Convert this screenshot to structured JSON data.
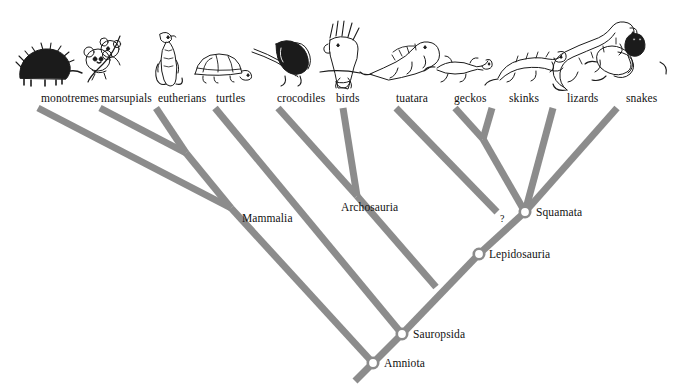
{
  "figure": {
    "background_color": "#ffffff",
    "branch_color": "#8c8c8c",
    "branch_width": 7,
    "node_marker_fill": "#ffffff",
    "node_marker_stroke": "#8c8c8c",
    "text_color": "#111111"
  },
  "taxa": [
    {
      "id": "monotremes",
      "label": "monotremes",
      "label_x": 41,
      "label_y": 92,
      "tip_x": 38,
      "tip_y": 108,
      "icon": "echidna-icon"
    },
    {
      "id": "marsupials",
      "label": "marsupials",
      "label_x": 101,
      "label_y": 92,
      "tip_x": 100,
      "tip_y": 108,
      "icon": "koala-icon"
    },
    {
      "id": "eutherians",
      "label": "eutherians",
      "label_x": 158,
      "label_y": 92,
      "tip_x": 156,
      "tip_y": 108,
      "icon": "meerkat-icon"
    },
    {
      "id": "turtles",
      "label": "turtles",
      "label_x": 216,
      "label_y": 92,
      "tip_x": 215,
      "tip_y": 108,
      "icon": "tortoise-icon"
    },
    {
      "id": "crocodiles",
      "label": "crocodiles",
      "label_x": 277,
      "label_y": 92,
      "tip_x": 278,
      "tip_y": 108,
      "icon": "crocodile-icon"
    },
    {
      "id": "birds",
      "label": "birds",
      "label_x": 336,
      "label_y": 92,
      "tip_x": 343,
      "tip_y": 108,
      "icon": "cockatoo-icon"
    },
    {
      "id": "tuatara",
      "label": "tuatara",
      "label_x": 396,
      "label_y": 92,
      "tip_x": 396,
      "tip_y": 108,
      "icon": "tuatara-icon"
    },
    {
      "id": "geckos",
      "label": "geckos",
      "label_x": 454,
      "label_y": 92,
      "tip_x": 455,
      "tip_y": 108,
      "icon": "gecko-icon"
    },
    {
      "id": "skinks",
      "label": "skinks",
      "label_x": 509,
      "label_y": 92,
      "tip_x": 492,
      "tip_y": 108,
      "icon": "skink-icon"
    },
    {
      "id": "lizards",
      "label": "lizards",
      "label_x": 567,
      "label_y": 92,
      "tip_x": 553,
      "tip_y": 108,
      "icon": "lizard-icon"
    },
    {
      "id": "snakes",
      "label": "snakes",
      "label_x": 626,
      "label_y": 92,
      "tip_x": 617,
      "tip_y": 108,
      "icon": "snake-icon"
    }
  ],
  "clades": [
    {
      "id": "mammalia",
      "label": "Mammalia",
      "label_x": 242,
      "label_y": 212,
      "node_x": 0,
      "node_y": 0,
      "has_marker": false
    },
    {
      "id": "archosauria",
      "label": "Archosauria",
      "label_x": 341,
      "label_y": 201,
      "node_x": 0,
      "node_y": 0,
      "has_marker": false
    },
    {
      "id": "squamata",
      "label": "Squamata",
      "label_x": 536,
      "label_y": 206,
      "node_x": 525,
      "node_y": 212,
      "has_marker": true
    },
    {
      "id": "lepidosauria",
      "label": "Lepidosauria",
      "label_x": 489,
      "label_y": 248,
      "node_x": 479,
      "node_y": 254,
      "has_marker": true
    },
    {
      "id": "sauropsida",
      "label": "Sauropsida",
      "label_x": 413,
      "label_y": 328,
      "node_x": 402,
      "node_y": 334,
      "has_marker": true
    },
    {
      "id": "amniota",
      "label": "Amniota",
      "label_x": 384,
      "label_y": 357,
      "node_x": 373,
      "node_y": 363,
      "has_marker": true
    }
  ],
  "annotations": [
    {
      "id": "uncertain-tuatara-placement",
      "text": "?",
      "x": 500,
      "y": 213
    }
  ],
  "chart_data": {
    "type": "cladogram",
    "tip_taxa": [
      "monotremes",
      "marsupials",
      "eutherians",
      "turtles",
      "crocodiles",
      "birds",
      "tuatara",
      "geckos",
      "skinks",
      "lizards",
      "snakes"
    ],
    "named_clades": [
      "Mammalia",
      "Archosauria",
      "Squamata",
      "Lepidosauria",
      "Sauropsida",
      "Amniota"
    ],
    "newick": "(((monotremes,(marsupials,eutherians))Mammalia,(turtles,((crocodiles,birds)Archosauria,(tuatara,((geckos,skinks),(lizards,snakes))Squamata)Lepidosauria))Sauropsida))Amniota;",
    "branch_segments": [
      {
        "name": "monotremes-branch",
        "x1": 38,
        "y1": 108,
        "x2": 231,
        "y2": 208
      },
      {
        "name": "marsupials-branch",
        "x1": 100,
        "y1": 108,
        "x2": 186,
        "y2": 153
      },
      {
        "name": "eutherians-branch",
        "x1": 156,
        "y1": 108,
        "x2": 186,
        "y2": 153
      },
      {
        "name": "marsupial-eutherian-stem",
        "x1": 186,
        "y1": 153,
        "x2": 231,
        "y2": 208
      },
      {
        "name": "mammalia-stem",
        "x1": 231,
        "y1": 208,
        "x2": 373,
        "y2": 363
      },
      {
        "name": "turtles-branch",
        "x1": 215,
        "y1": 108,
        "x2": 402,
        "y2": 334
      },
      {
        "name": "crocodiles-branch",
        "x1": 278,
        "y1": 108,
        "x2": 357,
        "y2": 196
      },
      {
        "name": "birds-branch",
        "x1": 343,
        "y1": 108,
        "x2": 357,
        "y2": 196
      },
      {
        "name": "archosauria-stem",
        "x1": 357,
        "y1": 196,
        "x2": 436,
        "y2": 287
      },
      {
        "name": "tuatara-branch",
        "x1": 396,
        "y1": 108,
        "x2": 497,
        "y2": 212
      },
      {
        "name": "geckos-branch",
        "x1": 455,
        "y1": 108,
        "x2": 483,
        "y2": 139
      },
      {
        "name": "skinks-branch",
        "x1": 492,
        "y1": 108,
        "x2": 483,
        "y2": 139
      },
      {
        "name": "gecko-skink-stem",
        "x1": 483,
        "y1": 139,
        "x2": 525,
        "y2": 212
      },
      {
        "name": "lizards-branch",
        "x1": 553,
        "y1": 108,
        "x2": 525,
        "y2": 212
      },
      {
        "name": "snakes-branch",
        "x1": 617,
        "y1": 108,
        "x2": 525,
        "y2": 212
      },
      {
        "name": "squamata-stem",
        "x1": 525,
        "y1": 212,
        "x2": 479,
        "y2": 254
      },
      {
        "name": "lepidosauria-stem",
        "x1": 479,
        "y1": 254,
        "x2": 402,
        "y2": 334
      },
      {
        "name": "sauropsida-stem",
        "x1": 402,
        "y1": 334,
        "x2": 373,
        "y2": 363
      },
      {
        "name": "amniota-root",
        "x1": 373,
        "y1": 363,
        "x2": 355,
        "y2": 381
      }
    ]
  }
}
